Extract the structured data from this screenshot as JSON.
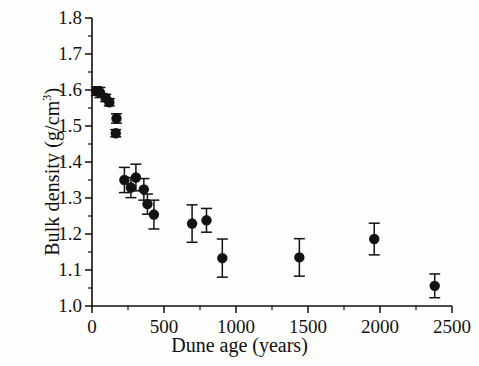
{
  "figure": {
    "background_color": "#fdfdfb",
    "ink_color": "#100f0d",
    "marker_color": "#121212"
  },
  "axes": {
    "x_title": "Dune age (years)",
    "y_title_main": "Bulk density (g/cm",
    "y_title_exp": "3",
    "y_title_close": ")",
    "y_title_full": "Bulk density (g/cm3)",
    "x_ticks": [
      "0",
      "500",
      "1000",
      "1500",
      "2000",
      "2500"
    ],
    "y_ticks": [
      "1.8",
      "1.7",
      "1.6",
      "1.5",
      "1.4",
      "1.3",
      "1.2",
      "1.1",
      "1.0"
    ]
  },
  "chart_data": {
    "type": "scatter",
    "title": "",
    "xlabel": "Dune age (years)",
    "ylabel": "Bulk density (g/cm^3)",
    "xlim": [
      0,
      2500
    ],
    "ylim": [
      1.0,
      1.8
    ],
    "x_tick_values": [
      0,
      500,
      1000,
      1500,
      2000,
      2500
    ],
    "y_tick_values": [
      1.0,
      1.1,
      1.2,
      1.3,
      1.4,
      1.5,
      1.6,
      1.7,
      1.8
    ],
    "x_minor_tick_interval": 250,
    "y_minor_tick_interval": 0.05,
    "grid": false,
    "legend": false,
    "error_bars": "vertical",
    "marker": "filled-circle",
    "series": [
      {
        "name": "Bulk density vs dune age",
        "points": [
          {
            "x": 30,
            "y": 1.597,
            "yerr": 0.012
          },
          {
            "x": 55,
            "y": 1.593,
            "yerr": 0.014
          },
          {
            "x": 95,
            "y": 1.578,
            "yerr": 0.01
          },
          {
            "x": 120,
            "y": 1.566,
            "yerr": 0.01
          },
          {
            "x": 170,
            "y": 1.521,
            "yerr": 0.013
          },
          {
            "x": 165,
            "y": 1.48,
            "yerr": 0.01
          },
          {
            "x": 225,
            "y": 1.35,
            "yerr": 0.035
          },
          {
            "x": 270,
            "y": 1.329,
            "yerr": 0.028
          },
          {
            "x": 305,
            "y": 1.357,
            "yerr": 0.037
          },
          {
            "x": 360,
            "y": 1.324,
            "yerr": 0.03
          },
          {
            "x": 385,
            "y": 1.283,
            "yerr": 0.028
          },
          {
            "x": 430,
            "y": 1.254,
            "yerr": 0.04
          },
          {
            "x": 695,
            "y": 1.229,
            "yerr": 0.052
          },
          {
            "x": 795,
            "y": 1.238,
            "yerr": 0.033
          },
          {
            "x": 905,
            "y": 1.133,
            "yerr": 0.053
          },
          {
            "x": 1440,
            "y": 1.135,
            "yerr": 0.052
          },
          {
            "x": 1960,
            "y": 1.186,
            "yerr": 0.044
          },
          {
            "x": 2380,
            "y": 1.056,
            "yerr": 0.033
          }
        ]
      }
    ]
  }
}
